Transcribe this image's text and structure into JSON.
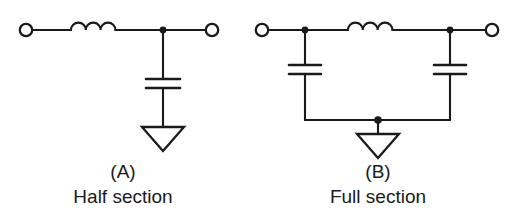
{
  "figure": {
    "background_color": "#ffffff",
    "line_color": "#1a1a1a",
    "type": "schematic-diagram"
  },
  "circuits": [
    {
      "id": "A",
      "caption_id": "(A)",
      "caption_name": "Half section",
      "caption_center_x": 123,
      "components": {
        "inductor": {
          "name": "series-inductor",
          "humps": 3
        },
        "capacitor": {
          "name": "shunt-capacitor",
          "plates": 2
        },
        "ground": {
          "name": "ground-symbol",
          "shape": "open-triangle"
        },
        "terminals": [
          {
            "name": "left-terminal",
            "cx": 26,
            "cy": 30,
            "r": 6
          },
          {
            "name": "right-terminal",
            "cx": 212,
            "cy": 30,
            "r": 6
          }
        ],
        "nodes": [
          {
            "name": "junction-node",
            "cx": 163,
            "cy": 30,
            "r": 3.2
          }
        ]
      }
    },
    {
      "id": "B",
      "caption_id": "(B)",
      "caption_name": "Full section",
      "caption_center_x": 378,
      "components": {
        "inductor": {
          "name": "series-inductor",
          "humps": 3
        },
        "capacitors": [
          {
            "name": "shunt-capacitor-left",
            "plates": 2
          },
          {
            "name": "shunt-capacitor-right",
            "plates": 2
          }
        ],
        "ground": {
          "name": "ground-symbol",
          "shape": "open-triangle"
        },
        "terminals": [
          {
            "name": "left-terminal",
            "cx": 262,
            "cy": 30,
            "r": 6
          },
          {
            "name": "right-terminal",
            "cx": 492,
            "cy": 30,
            "r": 6
          }
        ],
        "nodes": [
          {
            "name": "left-junction-node",
            "cx": 305,
            "cy": 30,
            "r": 3.2
          },
          {
            "name": "right-junction-node",
            "cx": 450,
            "cy": 30,
            "r": 3.2
          },
          {
            "name": "ground-rail-node",
            "cx": 378,
            "cy": 120,
            "r": 3.6
          }
        ]
      }
    }
  ],
  "labels": {
    "a_id": "(A)",
    "a_name": "Half section",
    "b_id": "(B)",
    "b_name": "Full section"
  }
}
